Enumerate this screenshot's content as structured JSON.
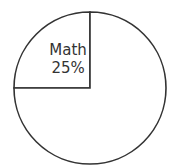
{
  "chart_data": {
    "type": "pie",
    "title": "",
    "slices": [
      {
        "label": "Math",
        "value": 25,
        "value_label": "25%",
        "show_label": true
      },
      {
        "label": "",
        "value": 75,
        "value_label": "",
        "show_label": false
      }
    ],
    "start_angle": "top",
    "direction": "counter-clockwise",
    "legend": "none",
    "colors": {
      "fill": "#ffffff",
      "stroke": "#333333"
    }
  }
}
